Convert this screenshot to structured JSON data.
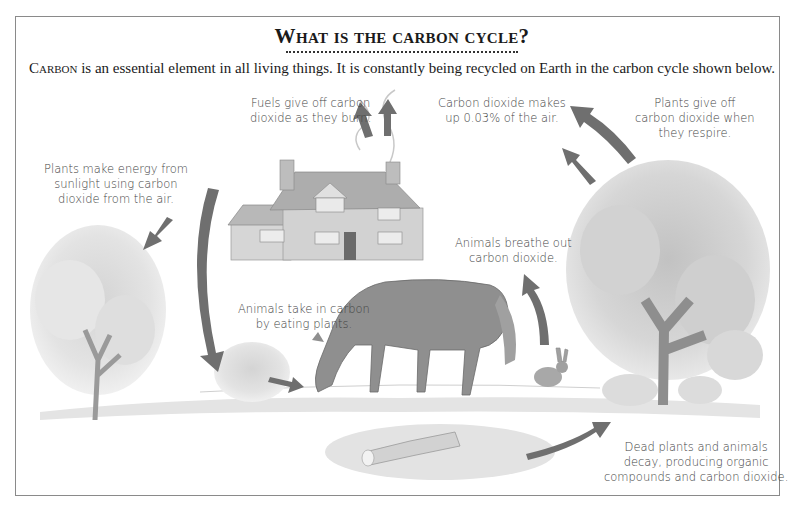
{
  "heading": {
    "title": "What is the carbon cycle?",
    "intro_lead": "Carbon",
    "intro_rest": " is an essential element in all living things. It is constantly being recycled on Earth in the carbon cycle shown below."
  },
  "labels": {
    "fuels": [
      "Fuels give off carbon",
      "dioxide as they burn."
    ],
    "air": [
      "Carbon dioxide makes",
      "up 0.03% of the air."
    ],
    "plants_respire": [
      "Plants give off",
      "carbon dioxide when",
      "they respire."
    ],
    "photosynthesis": [
      "Plants make energy from",
      "sunlight using carbon",
      "dioxide from the air."
    ],
    "animals_breathe": [
      "Animals breathe out",
      "carbon dioxide."
    ],
    "animals_eat": [
      "Animals take in carbon",
      "by eating plants."
    ],
    "decay": [
      "Dead plants and animals",
      "decay, producing organic",
      "compounds and carbon dioxide."
    ]
  },
  "illustrations": {
    "left_tree": "deciduous tree (left)",
    "house": "brick house with smoking chimneys",
    "horse": "grazing horse",
    "rabbit": "rabbit",
    "right_tree": "large deciduous tree (right)",
    "bush": "small bush",
    "log": "decaying log and leaf litter"
  },
  "colors": {
    "arrow": "#6f6f6f",
    "frame": "#8a8a8a",
    "text": "#444444",
    "title": "#1a1a1a"
  }
}
